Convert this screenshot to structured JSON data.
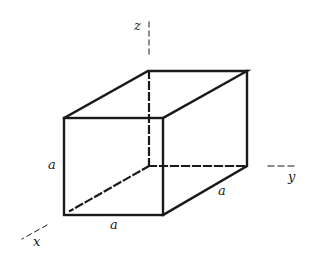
{
  "diagram": {
    "type": "rectangular-prism-with-axes",
    "axes": {
      "x": "x",
      "y": "y",
      "z": "z"
    },
    "edge_labels": {
      "height": "a",
      "width": "a",
      "depth": "a"
    },
    "colors": {
      "line": "#1a1a1a",
      "background": "#ffffff"
    }
  }
}
